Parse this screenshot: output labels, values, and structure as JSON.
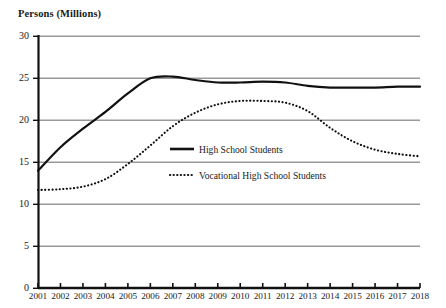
{
  "chart_data": {
    "type": "line",
    "title": "Persons (Millions)",
    "xlabel": "",
    "ylabel": "Persons (Millions)",
    "ylim": [
      0,
      30
    ],
    "yticks": [
      0,
      5,
      10,
      15,
      20,
      25,
      30
    ],
    "grid": true,
    "legend_position": "center",
    "x": [
      2001,
      2002,
      2003,
      2004,
      2005,
      2006,
      2007,
      2008,
      2009,
      2010,
      2011,
      2012,
      2013,
      2014,
      2015,
      2016,
      2017,
      2018
    ],
    "categories": [
      "2001",
      "2002",
      "2003",
      "2004",
      "2005",
      "2006",
      "2007",
      "2008",
      "2009",
      "2010",
      "2011",
      "2012",
      "2013",
      "2014",
      "2015",
      "2016",
      "2017",
      "2018"
    ],
    "series": [
      {
        "name": "High School Students",
        "style": "solid",
        "color": "#111111",
        "values": [
          14.0,
          16.8,
          19.0,
          21.0,
          23.2,
          25.0,
          25.2,
          24.8,
          24.5,
          24.5,
          24.6,
          24.5,
          24.1,
          23.9,
          23.9,
          23.9,
          24.0,
          24.0
        ]
      },
      {
        "name": "Vocational High School Students",
        "style": "dotted",
        "color": "#111111",
        "values": [
          11.7,
          11.8,
          12.1,
          13.0,
          14.8,
          17.0,
          19.3,
          20.9,
          21.9,
          22.3,
          22.3,
          22.1,
          21.1,
          19.1,
          17.5,
          16.5,
          16.0,
          15.7
        ]
      }
    ]
  },
  "axis": {
    "y_title": "Persons (Millions)",
    "y_tick_labels": [
      "30",
      "25",
      "20",
      "15",
      "10",
      "5",
      "0"
    ],
    "x_tick_labels": [
      "2001",
      "2002",
      "2003",
      "2004",
      "2005",
      "2006",
      "2007",
      "2008",
      "2009",
      "2010",
      "2011",
      "2012",
      "2013",
      "2014",
      "2015",
      "2016",
      "2017",
      "2018"
    ]
  },
  "legend": {
    "items": [
      {
        "label": "High School Students",
        "style": "solid"
      },
      {
        "label": "Vocational High School Students",
        "style": "dotted"
      }
    ]
  },
  "colors": {
    "line": "#111111",
    "grid": "#9a9a9a",
    "axis": "#111111",
    "background": "#ffffff"
  }
}
